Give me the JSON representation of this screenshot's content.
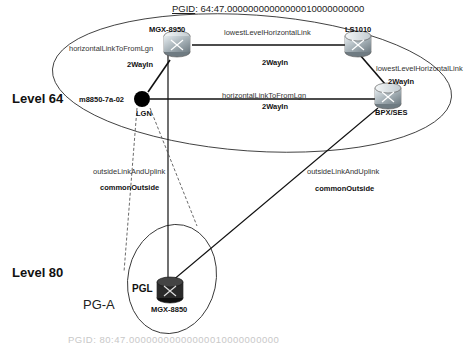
{
  "header": {
    "pgid_label": "PGID",
    "pgid_value": ": 64:47.00000000000000010000000000"
  },
  "levels": [
    {
      "label": "Level 64"
    },
    {
      "label": "Level 80"
    }
  ],
  "peer_groups": [
    {
      "label": "PG-A"
    }
  ],
  "nodes": {
    "mgx8950": {
      "label": "MGX-8950",
      "icon": "switch-icon"
    },
    "ls1010": {
      "label": "LS1010",
      "icon": "switch-icon"
    },
    "lgn": {
      "label": "LGN",
      "sublabel": "m8850-7a-02",
      "icon": "logical-group-node-dot"
    },
    "bpxses": {
      "label": "BPX/SES",
      "icon": "switch-icon"
    },
    "mgx8850": {
      "label": "MGX-8850",
      "role": "PGL",
      "icon": "switch-icon-dark"
    }
  },
  "links": [
    {
      "type": "horizontalLinkToFromLgn",
      "state": "2WayIn",
      "from": "MGX-8950",
      "to": "LGN"
    },
    {
      "type": "lowestLevelHorizontalLink",
      "state": "2WayIn",
      "from": "MGX-8950",
      "to": "LS1010"
    },
    {
      "type": "lowestLevelHorizontalLink",
      "state": "2WayIn",
      "from": "LS1010",
      "to": "BPX/SES"
    },
    {
      "type": "horizontalLinkToFromLgn",
      "state": "2WayIn",
      "from": "LGN",
      "to": "BPX/SES"
    },
    {
      "type": "outsideLinkAndUplink",
      "state": "commonOutside",
      "from": "LGN",
      "to": "MGX-8850"
    },
    {
      "type": "outsideLinkAndUplink",
      "state": "commonOutside",
      "from": "BPX/SES",
      "to": "MGX-8850"
    }
  ],
  "footer": {
    "pgid_partial": "PGID: 80:47.00000000000000010000000000"
  }
}
